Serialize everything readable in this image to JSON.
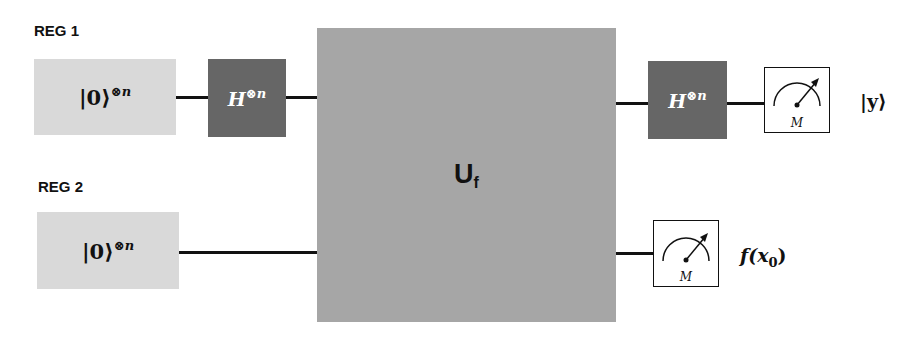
{
  "registers": [
    {
      "label": "REG 1",
      "init_state": "|0⟩",
      "init_exponent": "⊗n"
    },
    {
      "label": "REG 2",
      "init_state": "|0⟩",
      "init_exponent": "⊗n"
    }
  ],
  "gates": {
    "hadamard_1": {
      "symbol": "H",
      "exponent": "⊗n"
    },
    "oracle": {
      "symbol": "U",
      "subscript": "f"
    },
    "hadamard_2": {
      "symbol": "H",
      "exponent": "⊗n"
    }
  },
  "measurements": [
    {
      "meter_label": "M",
      "output": "|y⟩"
    },
    {
      "meter_label": "M",
      "output_prefix": "f(x",
      "output_sub": "0",
      "output_suffix": ")"
    }
  ],
  "colors": {
    "init_box": "#d9d9d9",
    "hadamard_box": "#666666",
    "oracle_box": "#a6a6a6",
    "wire": "#111111"
  }
}
